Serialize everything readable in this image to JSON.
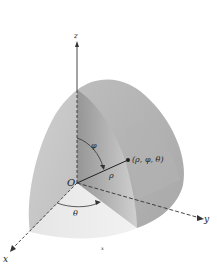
{
  "figure": {
    "labels": {
      "z_axis": "z",
      "y_axis": "y",
      "x_axis": "x",
      "origin": "O",
      "point": "(ρ, φ, θ)",
      "rho": "ρ",
      "phi": "φ",
      "theta": "θ",
      "bottom_mark": "x"
    },
    "colors": {
      "surface_light": "#d9d9d9",
      "surface_mid": "#c4c4c4",
      "surface_dark": "#a9a9a9",
      "surface_inner": "#bdbdbd",
      "axis": "#333333"
    }
  }
}
